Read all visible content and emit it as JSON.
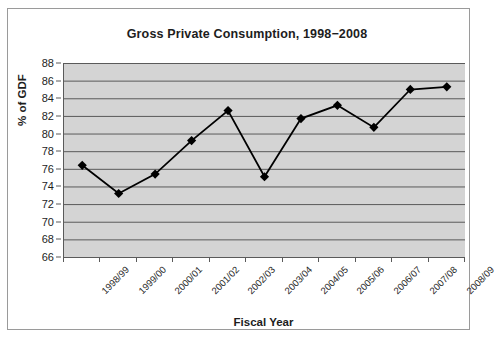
{
  "chart_data": {
    "type": "line",
    "title": "Gross Private Consumption, 1998−2008",
    "xlabel": "Fiscal Year",
    "ylabel": "% of GDF",
    "categories": [
      "1998/99",
      "1999/00",
      "2000/01",
      "2001/02",
      "2002/03",
      "2003/04",
      "2004/05",
      "2005/06",
      "2006/07",
      "2007/08",
      "2008/09"
    ],
    "values": [
      76.4,
      73.2,
      75.4,
      79.2,
      82.6,
      75.1,
      81.7,
      83.2,
      80.7,
      85.0,
      85.3
    ],
    "series": [
      {
        "name": "% of GDF",
        "values": [
          76.4,
          73.2,
          75.4,
          79.2,
          82.6,
          75.1,
          81.7,
          83.2,
          80.7,
          85.0,
          85.3
        ]
      }
    ],
    "ylim": [
      66,
      88
    ],
    "ytick_step": 2,
    "yticks": [
      88,
      86,
      84,
      82,
      80,
      78,
      76,
      74,
      72,
      70,
      68,
      66
    ],
    "grid": "horizontal",
    "legend": "none",
    "marker": "diamond",
    "colors": {
      "plot_background": "#d4d4d4",
      "gridline": "#5a5a5a",
      "series_line": "#000000",
      "marker_fill": "#000000",
      "axis": "#5a5a5a",
      "frame_border": "#9a9a9a",
      "text": "#1d1d1d"
    }
  }
}
